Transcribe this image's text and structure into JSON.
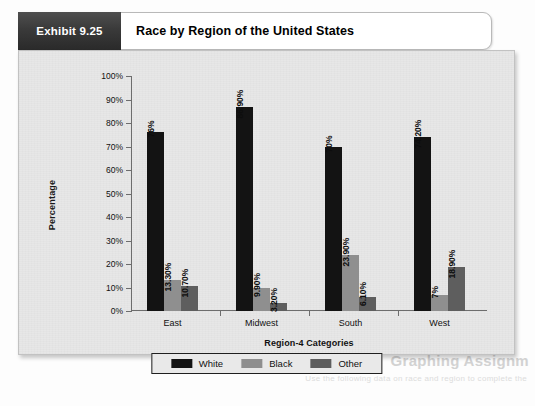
{
  "exhibit": {
    "tab_label": "Exhibit 9.25",
    "title": "Race by Region of the United States"
  },
  "bleed_through": {
    "heading": "Graphing Assignm",
    "subtext": "Use the following data on race and region to complete the"
  },
  "chart_data": {
    "type": "bar",
    "title": "Race by Region of the United States",
    "xlabel": "Region-4 Categories",
    "ylabel": "Percentage",
    "categories": [
      "East",
      "Midwest",
      "South",
      "West"
    ],
    "ylim": [
      0,
      100
    ],
    "ytick_labels": [
      "0%",
      "10%",
      "20%",
      "30%",
      "40%",
      "50%",
      "60%",
      "70%",
      "80%",
      "90%",
      "100%"
    ],
    "ytick_values": [
      0,
      10,
      20,
      30,
      40,
      50,
      60,
      70,
      80,
      90,
      100
    ],
    "grid": false,
    "legend_position": "bottom",
    "series": [
      {
        "name": "White",
        "color": "#131313",
        "values": [
          76,
          86.9,
          70,
          74.2
        ],
        "labels": [
          "76%",
          "86.90%",
          "70%",
          "74.20%"
        ]
      },
      {
        "name": "Black",
        "color": "#8f8f8f",
        "values": [
          13.3,
          9.9,
          23.9,
          7
        ],
        "labels": [
          "13.30%",
          "9.90%",
          "23.90%",
          "7%"
        ]
      },
      {
        "name": "Other",
        "color": "#5e5e5e",
        "values": [
          10.7,
          3.2,
          6.1,
          18.9
        ],
        "labels": [
          "10.70%",
          "3.20%",
          "6.10%",
          "18.90%"
        ]
      }
    ]
  }
}
